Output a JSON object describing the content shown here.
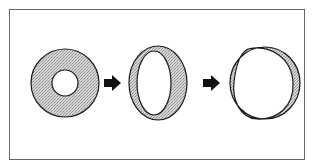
{
  "diagram": {
    "colors": {
      "stroke": "#1a1a1a",
      "fill": "#c8c8c8",
      "frame": "#555555",
      "background": "#ffffff",
      "arrow": "#111111"
    },
    "stages": [
      {
        "id": "stage-1",
        "label": "thick-ring"
      },
      {
        "id": "stage-2",
        "label": "ellipse-ring"
      },
      {
        "id": "stage-3",
        "label": "thin-crescent-ring"
      }
    ],
    "arrows": [
      {
        "id": "arrow-1",
        "from": "stage-1",
        "to": "stage-2"
      },
      {
        "id": "arrow-2",
        "from": "stage-2",
        "to": "stage-3"
      }
    ]
  }
}
